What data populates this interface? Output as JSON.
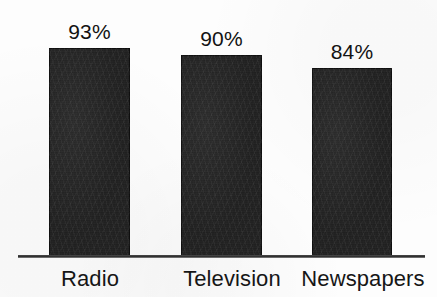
{
  "chart_data": {
    "type": "bar",
    "title": "",
    "subtitle": "",
    "xlabel": "",
    "ylabel": "",
    "grid": false,
    "legend": false,
    "ylim": [
      0,
      100
    ],
    "categories": [
      "Radio",
      "Television",
      "Newspapers"
    ],
    "values": [
      93,
      90,
      84
    ],
    "value_labels": [
      "93%",
      "90%",
      "84%"
    ],
    "bars": [
      {
        "category": "Radio",
        "value": 93,
        "label": "93%"
      },
      {
        "category": "Television",
        "value": 90,
        "label": "90%"
      },
      {
        "category": "Newspapers",
        "value": 84,
        "label": "84%"
      }
    ],
    "colors": {
      "bar_fill": "#1b1b1b",
      "axis": "#2e2e2e",
      "text": "#121212",
      "background": "#fdfdfd"
    }
  }
}
